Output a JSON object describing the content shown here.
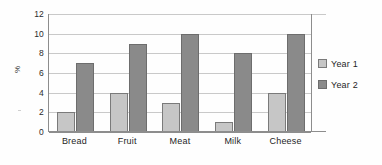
{
  "chart_data": {
    "type": "bar",
    "title": "",
    "xlabel": "",
    "ylabel": "%",
    "ylim": [
      0,
      12
    ],
    "yticks": [
      0,
      2,
      4,
      6,
      8,
      10,
      12
    ],
    "grid": true,
    "legend_position": "right",
    "categories": [
      "Bread",
      "Fruit",
      "Meat",
      "Milk",
      "Cheese"
    ],
    "series": [
      {
        "name": "Year 1",
        "color": "#c6c6c6",
        "values": [
          2,
          4,
          3,
          1,
          4
        ]
      },
      {
        "name": "Year 2",
        "color": "#8a8a8a",
        "values": [
          7,
          9,
          10,
          8,
          10
        ]
      }
    ]
  }
}
